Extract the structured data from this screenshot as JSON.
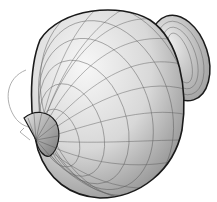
{
  "figure": {
    "colors": {
      "background": "#ffffff",
      "mesh_light": "#f2f2f2",
      "mesh_mid": "#cfcfcf",
      "mesh_dark": "#8a8a8a",
      "outline": "#1a1a1a",
      "grid_line": "#555555",
      "wire": "#9a9a9a"
    },
    "components": [
      {
        "name": "main-lobe",
        "shape": "sphere-like"
      },
      {
        "name": "side-lobe-torus",
        "shape": "torus",
        "position": "upper-right"
      },
      {
        "name": "back-lobe-cone",
        "shape": "cut cone",
        "position": "left"
      },
      {
        "name": "wire-outline",
        "shape": "thin curves",
        "position": "left edge"
      }
    ]
  }
}
